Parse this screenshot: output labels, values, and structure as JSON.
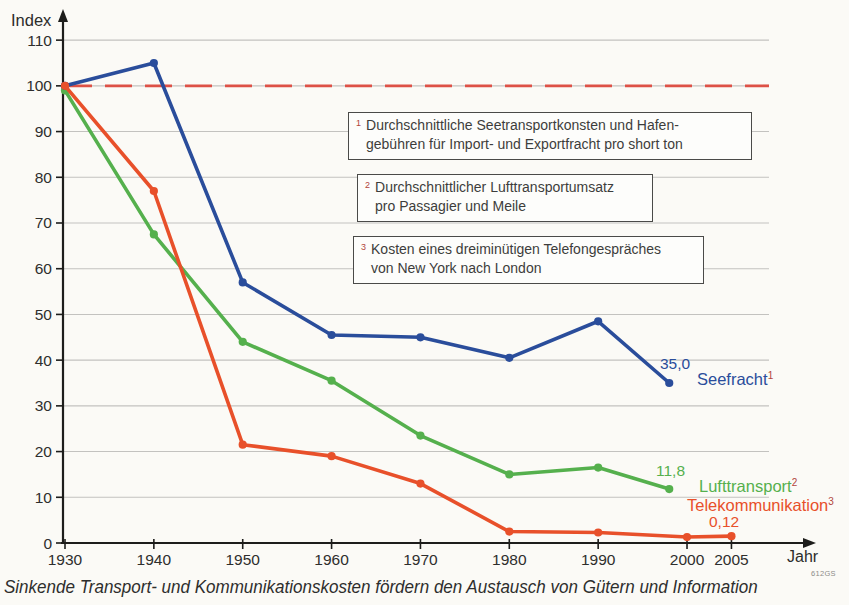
{
  "figure": {
    "code": "612GS",
    "caption": "Sinkende Transport- und Kommunikationskosten fördern den Austausch von Gütern und Information"
  },
  "colors": {
    "seefracht_blue": "#2a4d9b",
    "lufttransport_green": "#55b04d",
    "telekom_orange": "#e8502a",
    "baseline_red": "#dd5146",
    "grid_gray": "#c3c2bf",
    "axis_black": "#1d1d1b",
    "footnote_red": "#b2453c",
    "tick_text": "#2e2e2d"
  },
  "axes": {
    "y_label": "Index",
    "x_label": "Jahr",
    "y_ticks": [
      0,
      10,
      20,
      30,
      40,
      50,
      60,
      70,
      80,
      90,
      100,
      110
    ],
    "x_ticks": [
      1930,
      1940,
      1950,
      1960,
      1970,
      1980,
      1990,
      2000,
      2005
    ]
  },
  "chart_data": {
    "type": "line",
    "title": "",
    "xlabel": "Jahr",
    "ylabel": "Index",
    "xlim": [
      1930,
      2008
    ],
    "ylim": [
      0,
      115
    ],
    "grid": true,
    "baseline": {
      "value": 100,
      "style": "dashed",
      "color": "#dd5146"
    },
    "series": [
      {
        "name": "Seefracht",
        "footnote": "1",
        "color": "#2a4d9b",
        "end_label": "35,0",
        "points": [
          [
            1930,
            100
          ],
          [
            1940,
            105
          ],
          [
            1950,
            57
          ],
          [
            1960,
            45.5
          ],
          [
            1970,
            45
          ],
          [
            1980,
            40.5
          ],
          [
            1990,
            48.5
          ],
          [
            1998,
            35
          ]
        ]
      },
      {
        "name": "Lufttransport",
        "footnote": "2",
        "color": "#55b04d",
        "end_label": "11,8",
        "points": [
          [
            1930,
            99
          ],
          [
            1940,
            67.5
          ],
          [
            1950,
            44
          ],
          [
            1960,
            35.5
          ],
          [
            1970,
            23.5
          ],
          [
            1980,
            15
          ],
          [
            1990,
            16.5
          ],
          [
            1998,
            11.8
          ]
        ]
      },
      {
        "name": "Telekommunikation",
        "footnote": "3",
        "color": "#e8502a",
        "end_label": "0,12",
        "points": [
          [
            1930,
            100
          ],
          [
            1940,
            77
          ],
          [
            1950,
            21.5
          ],
          [
            1960,
            19
          ],
          [
            1970,
            13
          ],
          [
            1980,
            2.5
          ],
          [
            1990,
            2.3
          ],
          [
            2000,
            1.3
          ],
          [
            2005,
            1.5
          ]
        ]
      }
    ]
  },
  "footnotes": [
    {
      "num": "1",
      "text": "Durchschnittliche Seetransportkonsten und Hafen-\ngebühren für Import- und Exportfracht pro short ton"
    },
    {
      "num": "2",
      "text": "Durchschnittlicher Lufttransportumsatz\npro Passagier und Meile"
    },
    {
      "num": "3",
      "text": "Kosten eines dreiminütigen Telefongespräches\nvon New York nach London"
    }
  ]
}
